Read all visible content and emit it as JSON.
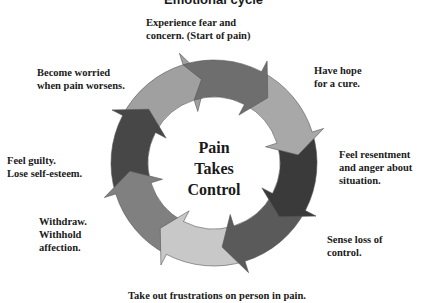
{
  "title": "Emotional cycle",
  "center": {
    "lines": [
      "Pain",
      "Takes",
      "Control"
    ]
  },
  "stages": [
    {
      "id": "top",
      "lines": [
        "Experience fear and",
        "concern.  (Start of pain)"
      ],
      "color": "#6e6e6e"
    },
    {
      "id": "top-right",
      "lines": [
        "Have hope",
        "for a cure."
      ],
      "color": "#a8a8a8"
    },
    {
      "id": "right",
      "lines": [
        "Feel resentment",
        "and anger about",
        "situation."
      ],
      "color": "#3a3a3a"
    },
    {
      "id": "bottom-right",
      "lines": [
        "Sense loss of",
        "control."
      ],
      "color": "#5a5a5a"
    },
    {
      "id": "bottom",
      "lines": [
        "Take out frustrations on person in pain."
      ],
      "color": "#c8c8c8"
    },
    {
      "id": "bottom-left",
      "lines": [
        "Withdraw.",
        "Withhold",
        "affection."
      ],
      "color": "#808080"
    },
    {
      "id": "left",
      "lines": [
        "Feel guilty.",
        "Lose self-esteem."
      ],
      "color": "#474747"
    },
    {
      "id": "top-left",
      "lines": [
        "Become worried",
        "when pain worsens."
      ],
      "color": "#a0a0a0"
    }
  ]
}
